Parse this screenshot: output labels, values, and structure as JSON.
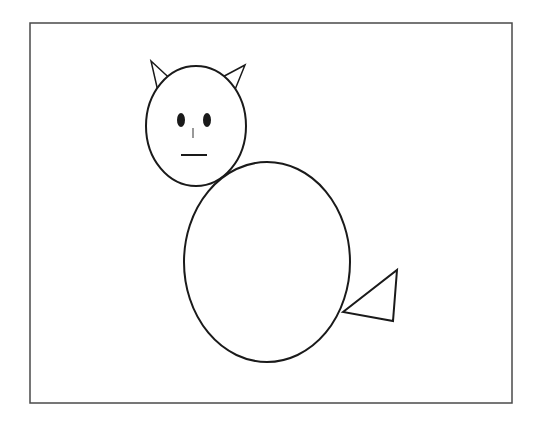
{
  "canvas": {
    "width": 541,
    "height": 424,
    "background": "#ffffff",
    "stroke_color": "#1a1a1a",
    "frame_color": "#4a4a4a"
  },
  "drawing": {
    "subject": "cat",
    "frame": {
      "x": 30,
      "y": 23,
      "width": 482,
      "height": 380
    },
    "head": {
      "cx": 196,
      "cy": 126,
      "rx": 50,
      "ry": 60
    },
    "left_ear": {
      "points": "151,61 178,86 159,96"
    },
    "right_ear": {
      "points": "245,65 215,81 232,97"
    },
    "left_eye": {
      "cx": 181,
      "cy": 120,
      "rx": 4,
      "ry": 7
    },
    "right_eye": {
      "cx": 207,
      "cy": 120,
      "rx": 4,
      "ry": 7
    },
    "nose": {
      "x1": 193,
      "y1": 128,
      "x2": 193,
      "y2": 138
    },
    "mouth": {
      "x1": 181,
      "y1": 155,
      "x2": 207,
      "y2": 155
    },
    "body": {
      "cx": 267,
      "cy": 262,
      "rx": 83,
      "ry": 100
    },
    "tail": {
      "points": "343,312 397,270 393,321"
    }
  }
}
